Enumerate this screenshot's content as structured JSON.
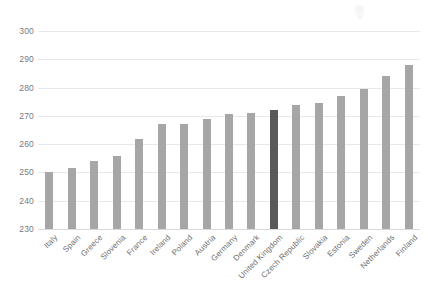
{
  "chart_data": {
    "type": "bar",
    "title": "",
    "subtitle": "",
    "xlabel": "",
    "ylabel": "",
    "ylim": [
      230,
      300
    ],
    "ytick_step": 10,
    "yticks": [
      230,
      240,
      250,
      260,
      270,
      280,
      290,
      300
    ],
    "grid": true,
    "legend": "none",
    "orientation": "vertical",
    "categories": [
      "Italy",
      "Spain",
      "Greece",
      "Slovenia",
      "France",
      "Ireland",
      "Poland",
      "Austria",
      "Germany",
      "Denmark",
      "United Kingdom",
      "Czech Republic",
      "Slovakia",
      "Estonia",
      "Sweden",
      "Netherlands",
      "Finland"
    ],
    "values": [
      250,
      251.5,
      254,
      256,
      262,
      267,
      267,
      269,
      270.5,
      271,
      272,
      274,
      274.5,
      277,
      279.5,
      284,
      288
    ],
    "highlight_index": 10,
    "highlight_label": "United Kingdom"
  },
  "style": {
    "bar_color": "#a6a6a6",
    "highlight_color": "#595959",
    "gridline_color": "#e8e8e8",
    "axis_color": "#d9d9d9",
    "tick_label_color": "#7a7a7a",
    "category_label_color": "#6e6e6e",
    "background": "#ffffff"
  }
}
